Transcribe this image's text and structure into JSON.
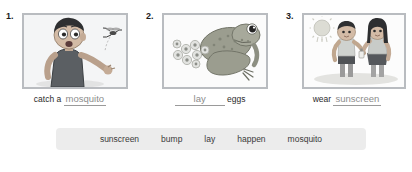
{
  "exercise": {
    "items": [
      {
        "number": "1.",
        "image_name": "boy-catching-mosquito-illustration",
        "caption_before": "catch a",
        "answer": "mosquito",
        "caption_after": ""
      },
      {
        "number": "2.",
        "image_name": "frog-with-eggs-illustration",
        "caption_before": "",
        "answer": "lay",
        "caption_after": "eggs"
      },
      {
        "number": "3.",
        "image_name": "children-applying-sunscreen-illustration",
        "caption_before": "wear",
        "answer": "sunscreen",
        "caption_after": ""
      }
    ]
  },
  "word_bank": {
    "words": [
      "sunscreen",
      "bump",
      "lay",
      "happen",
      "mosquito"
    ],
    "background_color": "#ececec"
  },
  "colors": {
    "frame_border": "#b9bcc0",
    "static_text": "#2b2b2b",
    "answer_text": "#8c8c8c",
    "page_background": "#ffffff"
  }
}
